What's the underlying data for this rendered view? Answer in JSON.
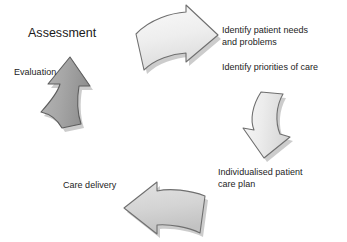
{
  "diagram": {
    "title_label": "Assessment",
    "background_color": "#ffffff",
    "text_color": "#232323",
    "labels": [
      {
        "id": "assessment",
        "text": "Assessment"
      },
      {
        "id": "identify_needs",
        "text": "Identify patient needs\nand problems"
      },
      {
        "id": "priorities",
        "text": "Identify priorities of care"
      },
      {
        "id": "care_plan",
        "text": "Individualised patient\ncare plan"
      },
      {
        "id": "care_delivery",
        "text": "Care delivery"
      },
      {
        "id": "evaluation",
        "text": "Evaluation"
      }
    ],
    "arrows": [
      {
        "id": "top",
        "direction": "right",
        "semantic": "assessment-to-identify-needs",
        "fill_light": "#f4f4f4",
        "fill_dark": "#e0e0e0",
        "stroke": "#6f6f6f",
        "shadow": "#9a9a9a"
      },
      {
        "id": "right",
        "direction": "down",
        "semantic": "priorities-to-care-plan",
        "fill_light": "#f2f2f2",
        "fill_dark": "#dcdcdc",
        "stroke": "#6f6f6f",
        "shadow": "#9a9a9a"
      },
      {
        "id": "bottom",
        "direction": "left",
        "semantic": "care-plan-to-care-delivery",
        "fill_light": "#dcdcdc",
        "fill_dark": "#c6c6c6",
        "stroke": "#6f6f6f",
        "shadow": "#9a9a9a"
      },
      {
        "id": "left",
        "direction": "up",
        "semantic": "care-delivery-to-evaluation",
        "fill_light": "#aeaeae",
        "fill_dark": "#949494",
        "stroke": "#5e5e5e",
        "shadow": "#8d8d8d"
      }
    ]
  }
}
